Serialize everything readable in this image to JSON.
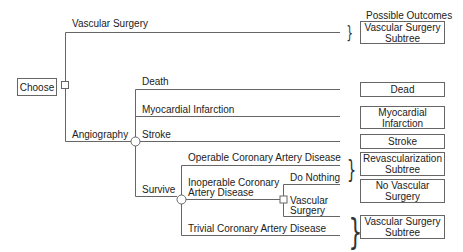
{
  "header": {
    "outcomes_title": "Possible Outcomes"
  },
  "root": {
    "label": "Choose"
  },
  "branches": {
    "vascular_surgery": "Vascular Surgery",
    "angiography": "Angiography",
    "death": "Death",
    "mi": "Myocardial Infarction",
    "stroke": "Stroke",
    "survive": "Survive",
    "operable": "Operable Coronary Artery Disease",
    "inoperable_1": "Inoperable Coronary",
    "inoperable_2": "Artery Disease",
    "do_nothing": "Do Nothing",
    "vs_sub_1": "Vascular",
    "vs_sub_2": "Surgery",
    "trivial": "Trivial Coronary Artery Disease"
  },
  "outcomes": {
    "vs_subtree_1": "Vascular Surgery",
    "vs_subtree_2": "Subtree",
    "dead": "Dead",
    "mi_1": "Myocardial",
    "mi_2": "Infarction",
    "stroke": "Stroke",
    "revasc_1": "Revascularization",
    "revasc_2": "Subtree",
    "no_vs_1": "No Vascular",
    "no_vs_2": "Surgery",
    "vs_subtree2_1": "Vascular Surgery",
    "vs_subtree2_2": "Subtree"
  },
  "braces": {
    "glyph": "}"
  },
  "colors": {
    "line": "#666666",
    "text": "#222222"
  }
}
